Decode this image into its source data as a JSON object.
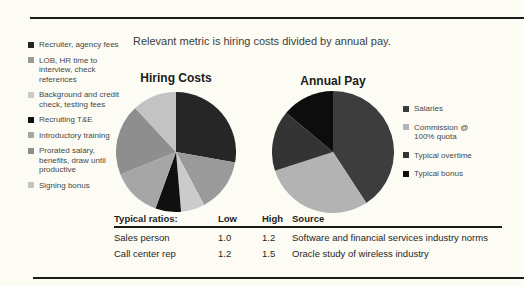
{
  "page": {
    "title": "Relevant metric is hiring costs divided by annual pay."
  },
  "chart_data": [
    {
      "type": "pie",
      "title": "Hiring Costs",
      "legend_position": "left",
      "slices": [
        {
          "label": "Recruiter, agency fees",
          "value": 27.8,
          "color": "#262626"
        },
        {
          "label": "LOB, HR time to interview, check references",
          "value": 14.4,
          "color": "#9a9a9a"
        },
        {
          "label": "Background and credit check, testing fees",
          "value": 6.4,
          "color": "#cbcbcb"
        },
        {
          "label": "Recruiting T&E",
          "value": 6.9,
          "color": "#101010"
        },
        {
          "label": "Introductory training",
          "value": 13.3,
          "color": "#a6a6a6"
        },
        {
          "label": "Prorated salary, benefits, draw until productive",
          "value": 19.2,
          "color": "#8e8e8e"
        },
        {
          "label": "Signing bonus",
          "value": 11.9,
          "color": "#c3c3c3"
        }
      ]
    },
    {
      "type": "pie",
      "title": "Annual Pay",
      "legend_position": "right",
      "slices": [
        {
          "label": "Salaries",
          "value": 40.8,
          "color": "#3d3d3d"
        },
        {
          "label": "Commission @ 100% quota",
          "value": 29.2,
          "color": "#b3b3b3"
        },
        {
          "label": "Typical overtime",
          "value": 16.1,
          "color": "#343434"
        },
        {
          "label": "Typical bonus",
          "value": 13.9,
          "color": "#0d0d0d"
        }
      ]
    }
  ],
  "table": {
    "header": {
      "label": "Typical ratios:",
      "low": "Low",
      "high": "High",
      "source": "Source"
    },
    "rows": [
      {
        "label": "Sales person",
        "low": "1.0",
        "high": "1.2",
        "source": "Software and financial services industry norms"
      },
      {
        "label": "Call center rep",
        "low": "1.2",
        "high": "1.5",
        "source": "Oracle study of wireless industry"
      }
    ]
  }
}
